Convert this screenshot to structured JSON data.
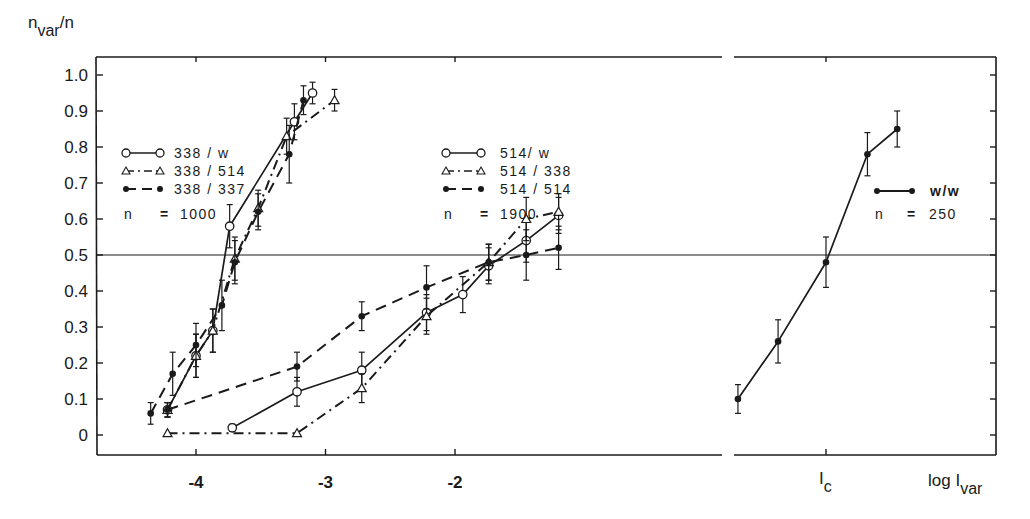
{
  "chart_data": {
    "type": "line",
    "title": "",
    "ylabel": "n_var/n",
    "xlabel": "log I_var",
    "ylim": [
      0,
      1.0
    ],
    "yticks": [
      "0",
      "0.1",
      "0.2",
      "0.3",
      "0.4",
      "0.5",
      "0.6",
      "0.7",
      "0.8",
      "0.9",
      "1.0"
    ],
    "xticks_left_panel": [
      "-4",
      "-3",
      "-2"
    ],
    "xtick_right_panel": "I_c",
    "reference_line": 0.5,
    "axis_break": true,
    "grid": false,
    "legend_groups": [
      {
        "entries": [
          "338 /  w",
          "338 / 514",
          "338 / 337"
        ],
        "n_label": "n",
        "n_sign": "=",
        "n_value": "1000"
      },
      {
        "entries": [
          "514/  w",
          "514 / 338",
          "514 / 514"
        ],
        "n_label": "n",
        "n_sign": "=",
        "n_value": "1900"
      },
      {
        "entries": [
          "w/w"
        ],
        "n_label": "n",
        "n_sign": "=",
        "n_value": "250"
      }
    ],
    "series": [
      {
        "name": "338 / w",
        "marker": "open-circle",
        "line": "solid",
        "x": [
          -4.22,
          -4.0,
          -3.87,
          -3.74,
          -3.24,
          -3.1
        ],
        "values": [
          0.07,
          0.22,
          0.29,
          0.58,
          0.87,
          0.95
        ],
        "err": [
          0.02,
          0.06,
          0.06,
          0.06,
          0.05,
          0.03
        ]
      },
      {
        "name": "338 / 514",
        "marker": "open-triangle",
        "line": "dash-dot",
        "x": [
          -4.22,
          -4.0,
          -3.87,
          -3.7,
          -3.52,
          -3.3,
          -2.93
        ],
        "values": [
          0.07,
          0.22,
          0.29,
          0.49,
          0.63,
          0.83,
          0.93
        ],
        "err": [
          0.02,
          0.06,
          0.06,
          0.06,
          0.05,
          0.05,
          0.03
        ]
      },
      {
        "name": "338 / 337",
        "marker": "filled-circle",
        "line": "dashed",
        "x": [
          -4.35,
          -4.18,
          -4.0,
          -3.8,
          -3.7,
          -3.52,
          -3.28,
          -3.17
        ],
        "values": [
          0.06,
          0.17,
          0.25,
          0.36,
          0.48,
          0.62,
          0.78,
          0.93
        ],
        "err": [
          0.03,
          0.06,
          0.06,
          0.07,
          0.06,
          0.05,
          0.08,
          0.04
        ]
      },
      {
        "name": "514 / w",
        "marker": "open-circle",
        "line": "solid",
        "x": [
          -3.72,
          -3.22,
          -2.72,
          -2.22,
          -1.94,
          -1.74,
          -1.45,
          -1.2
        ],
        "values": [
          0.02,
          0.12,
          0.18,
          0.34,
          0.39,
          0.47,
          0.54,
          0.61
        ],
        "err": [
          0.01,
          0.04,
          0.05,
          0.05,
          0.05,
          0.05,
          0.06,
          0.05
        ]
      },
      {
        "name": "514 / 338",
        "marker": "open-triangle",
        "line": "dash-dot",
        "x": [
          -4.22,
          -3.22,
          -2.72,
          -2.22,
          -1.74,
          -1.45,
          -1.2
        ],
        "values": [
          0.005,
          0.005,
          0.13,
          0.33,
          0.48,
          0.6,
          0.62
        ],
        "err": [
          0.0,
          0.0,
          0.04,
          0.05,
          0.05,
          0.06,
          0.05
        ]
      },
      {
        "name": "514 / 514",
        "marker": "filled-circle",
        "line": "dashed",
        "x": [
          -4.22,
          -3.22,
          -2.72,
          -2.22,
          -1.74,
          -1.45,
          -1.2
        ],
        "values": [
          0.07,
          0.19,
          0.33,
          0.41,
          0.48,
          0.5,
          0.52
        ],
        "err": [
          0.02,
          0.04,
          0.04,
          0.06,
          0.05,
          0.07,
          0.06
        ]
      },
      {
        "name": "w / w",
        "marker": "filled-circle",
        "line": "solid",
        "panel": "right",
        "x_relative_to_Ic": [
          -0.68,
          -0.37,
          0.0,
          0.32,
          0.55
        ],
        "values": [
          0.1,
          0.26,
          0.48,
          0.78,
          0.85
        ],
        "err": [
          0.04,
          0.06,
          0.07,
          0.06,
          0.05
        ]
      }
    ]
  },
  "labels": {
    "y_axis_main": "n",
    "y_axis_sub": "var",
    "y_axis_tail": "/n",
    "x_axis_main": "log  I",
    "x_axis_sub": "var",
    "ic_main": "I",
    "ic_sub": "c"
  }
}
